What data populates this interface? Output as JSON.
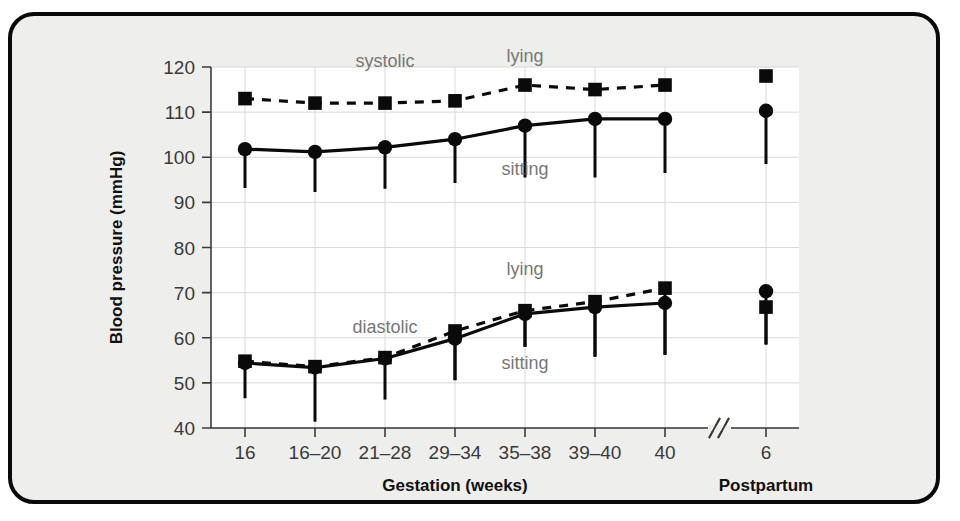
{
  "figure": {
    "frame_color": "#0a0a0a",
    "paper_color": "#eeeeec",
    "plot_color": "#ffffff"
  },
  "chart_data": {
    "type": "line",
    "title": "",
    "xlabel": "Gestation (weeks)",
    "xlabel_secondary": "Postpartum",
    "ylabel": "Blood pressure (mmHg)",
    "ylim": [
      40,
      120
    ],
    "yticks": [
      40,
      50,
      60,
      70,
      80,
      90,
      100,
      110,
      120
    ],
    "grid": true,
    "legend_position": "inline-annotations",
    "axis_break": true,
    "axis_break_label": "//",
    "categories": [
      "16",
      "16–20",
      "21–28",
      "29–34",
      "35–38",
      "39–40",
      "40",
      "6"
    ],
    "gestation_categories": [
      "16",
      "16–20",
      "21–28",
      "29–34",
      "35–38",
      "39–40",
      "40"
    ],
    "postpartum_categories": [
      "6"
    ],
    "annotations": [
      {
        "text": "systolic",
        "x_category": "21–28",
        "y_value": 120
      },
      {
        "text": "lying",
        "x_category": "35–38",
        "y_value": 121
      },
      {
        "text": "sitting",
        "x_category": "35–38",
        "y_value": 96
      },
      {
        "text": "diastolic",
        "x_category": "21–28",
        "y_value": 61
      },
      {
        "text": "lying",
        "x_category": "35–38",
        "y_value": 74
      },
      {
        "text": "sitting",
        "x_category": "35–38",
        "y_value": 53
      }
    ],
    "series": [
      {
        "name": "systolic lying",
        "marker": "square",
        "line_style": "dashed",
        "values": [
          113,
          112,
          112,
          112.5,
          116,
          115,
          116,
          118
        ],
        "errors_low": [
          null,
          null,
          null,
          null,
          null,
          null,
          null,
          null
        ]
      },
      {
        "name": "systolic sitting",
        "marker": "circle",
        "line_style": "solid",
        "values": [
          101.8,
          101.2,
          102.2,
          104,
          107,
          108.5,
          108.5,
          110.3
        ],
        "errors_low": [
          93.2,
          92.3,
          93,
          94.3,
          95.5,
          95.5,
          96.5,
          98.5
        ]
      },
      {
        "name": "diastolic lying",
        "marker": "square",
        "line_style": "dashed",
        "values": [
          54.8,
          53.6,
          55.6,
          61.5,
          66,
          68,
          71,
          66.8
        ],
        "errors_low": [
          null,
          null,
          null,
          50.6,
          58,
          55.8,
          56.2,
          58.5
        ]
      },
      {
        "name": "diastolic sitting",
        "marker": "circle",
        "line_style": "solid",
        "values": [
          54.4,
          53.4,
          55.4,
          59.8,
          65.3,
          66.8,
          67.7,
          70.3
        ],
        "errors_low": [
          46.6,
          41.4,
          46.3,
          50.6,
          58,
          55.8,
          56.2,
          58.5
        ]
      }
    ]
  }
}
